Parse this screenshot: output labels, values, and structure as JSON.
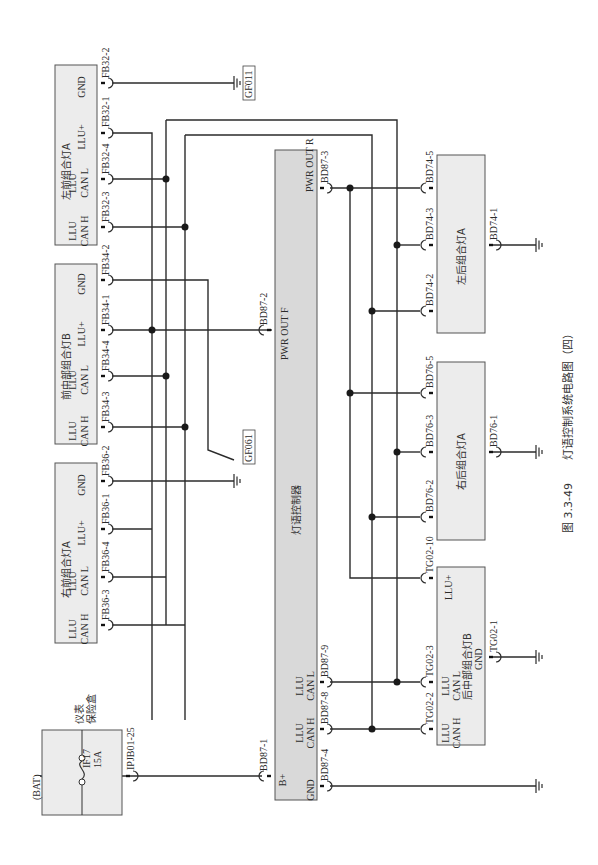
{
  "figure": {
    "caption_number": "图 3.3-49",
    "caption_title": "灯语控制系统电路图（四）"
  },
  "power_source": {
    "bat_label": "(BAT)",
    "fuse_box_name": "仪表保险盒",
    "fuse_box_name_line1": "仪表",
    "fuse_box_name_line2": "保险盒",
    "fuse_id": "IF17",
    "fuse_rating": "15A",
    "output_connector": "IPJB01-25"
  },
  "controller": {
    "name": "灯语控制器",
    "pins": {
      "b_plus": {
        "label": "B+",
        "connector": "BD87-1"
      },
      "gnd": {
        "label": "GND",
        "connector": "BD87-4"
      },
      "can_h": {
        "label_line1": "LLU",
        "label_line2": "CAN H",
        "connector": "BD87-8"
      },
      "can_l": {
        "label_line1": "LLU",
        "label_line2": "CAN L",
        "connector": "BD87-9"
      },
      "pwr_out_f": {
        "label": "PWR OUT F",
        "connector": "BD87-2"
      },
      "pwr_out_r": {
        "label": "PWR OUT R",
        "connector": "BD87-3"
      }
    }
  },
  "front_lamps": [
    {
      "name": "左前组合灯A",
      "pins": [
        {
          "label_line1": "LLU",
          "label_line2": "CAN H",
          "connector": "FB32-3"
        },
        {
          "label_line1": "LLU",
          "label_line2": "CAN L",
          "connector": "FB32-4"
        },
        {
          "label_line1": "",
          "label_line2": "LLU+",
          "connector": "FB32-1"
        },
        {
          "label_line1": "",
          "label_line2": "GND",
          "connector": "FB32-2"
        }
      ],
      "ground": "GF011"
    },
    {
      "name": "前中部组合灯B",
      "pins": [
        {
          "label_line1": "LLU",
          "label_line2": "CAN H",
          "connector": "FB34-3"
        },
        {
          "label_line1": "LLU",
          "label_line2": "CAN L",
          "connector": "FB34-4"
        },
        {
          "label_line1": "",
          "label_line2": "LLU+",
          "connector": "FB34-1"
        },
        {
          "label_line1": "",
          "label_line2": "GND",
          "connector": "FB34-2"
        }
      ],
      "ground": "GF061"
    },
    {
      "name": "右前组合灯A",
      "pins": [
        {
          "label_line1": "LLU",
          "label_line2": "CAN H",
          "connector": "FB36-3"
        },
        {
          "label_line1": "LLU",
          "label_line2": "CAN L",
          "connector": "FB36-4"
        },
        {
          "label_line1": "",
          "label_line2": "LLU+",
          "connector": "FB36-1"
        },
        {
          "label_line1": "",
          "label_line2": "GND",
          "connector": "FB36-2"
        }
      ],
      "ground": "GF061"
    }
  ],
  "rear_lamps": [
    {
      "name": "左后组合灯A",
      "connectors": {
        "power": "BD74-5",
        "can_l": "BD74-3",
        "can_h": "BD74-2",
        "gnd": "BD74-1"
      }
    },
    {
      "name": "右后组合灯A",
      "connectors": {
        "power": "BD76-5",
        "can_l": "BD76-3",
        "can_h": "BD76-2",
        "gnd": "BD76-1"
      }
    },
    {
      "name": "后中部组合灯B",
      "pins": {
        "can_h": {
          "label_line1": "LLU",
          "label_line2": "CAN H",
          "connector": "TG02-2"
        },
        "can_l": {
          "label_line1": "LLU",
          "label_line2": "CAN L",
          "connector": "TG02-3"
        },
        "power": {
          "label": "LLU+",
          "connector": "TG02-10"
        },
        "gnd": {
          "label": "GND",
          "connector": "TG02-1"
        }
      }
    }
  ],
  "grounds": {
    "gf011": "GF011",
    "gf061": "GF061"
  }
}
